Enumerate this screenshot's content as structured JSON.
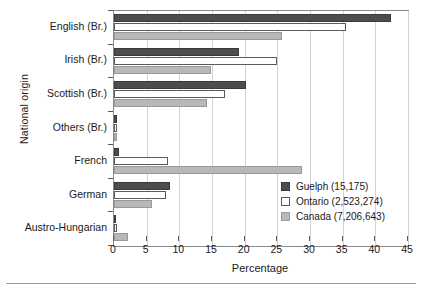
{
  "chart_data": {
    "type": "bar",
    "orientation": "horizontal",
    "title": "",
    "xlabel": "Percentage",
    "ylabel": "National origin",
    "xlim": [
      0,
      45
    ],
    "xticks": [
      0,
      5,
      10,
      15,
      20,
      25,
      30,
      35,
      40,
      45
    ],
    "grid": "vertical",
    "legend_position": "inside-right",
    "categories": [
      "English (Br.)",
      "Irish (Br.)",
      "Scottish (Br.)",
      "Others (Br.)",
      "French",
      "German",
      "Austro-Hungarian"
    ],
    "series": [
      {
        "name": "Guelph (15,175)",
        "label": "Guelph",
        "count": "15,175",
        "color": "#4d4d4d",
        "values": [
          42.4,
          19.1,
          20.2,
          0.4,
          0.8,
          8.6,
          0.3
        ]
      },
      {
        "name": "Ontario (2,523,274)",
        "label": "Ontario",
        "count": "2,523,274",
        "color": "#ffffff",
        "values": [
          35.5,
          25.0,
          17.0,
          0.4,
          8.3,
          7.9,
          0.5
        ]
      },
      {
        "name": "Canada (7,206,643)",
        "label": "Canada",
        "count": "7,206,643",
        "color": "#b8b8b8",
        "values": [
          25.7,
          14.9,
          14.2,
          0.4,
          28.8,
          5.8,
          2.1
        ]
      }
    ]
  },
  "axes": {
    "x_title": "Percentage",
    "y_title": "National origin",
    "x_tick_labels": [
      "0",
      "5",
      "10",
      "15",
      "20",
      "25",
      "30",
      "35",
      "40",
      "45"
    ],
    "y_tick_labels": [
      "English (Br.)",
      "Irish (Br.)",
      "Scottish (Br.)",
      "Others (Br.)",
      "French",
      "German",
      "Austro-Hungarian"
    ]
  },
  "legend": {
    "items": [
      {
        "label": "Guelph (15,175)",
        "swatch": "guelph"
      },
      {
        "label": "Ontario (2,523,274)",
        "swatch": "ontario"
      },
      {
        "label": "Canada (7,206,643)",
        "swatch": "canada"
      }
    ]
  },
  "colors": {
    "guelph": "#4d4d4d",
    "ontario": "#ffffff",
    "canada": "#b8b8b8",
    "grid": "#d2d2d2",
    "frame": "#8a8a8a"
  }
}
